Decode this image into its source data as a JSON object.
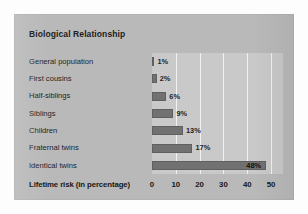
{
  "chart_data": {
    "type": "bar",
    "orientation": "horizontal",
    "title": "Biological Relationship",
    "xlabel": "Lifetime risk (in percentage)",
    "ylabel": "",
    "categories": [
      "General population",
      "First cousins",
      "Half-siblings",
      "Siblings",
      "Children",
      "Fraternal twins",
      "Identical twins"
    ],
    "values": [
      1,
      2,
      6,
      9,
      13,
      17,
      48
    ],
    "value_labels": [
      "1%",
      "2%",
      "6%",
      "9%",
      "13%",
      "17%",
      "48%"
    ],
    "xlim": [
      0,
      55
    ],
    "xticks": [
      0,
      10,
      20,
      30,
      40,
      50
    ],
    "xtick_labels": [
      "0",
      "10",
      "20",
      "30",
      "40",
      "50"
    ],
    "gridlines": [
      10,
      20,
      30,
      40,
      50
    ],
    "grid": true,
    "legend": "none",
    "bar_color": "#717171",
    "plot_background": "#c9c9c9",
    "panel_background": "#b9b9b9",
    "gridline_color": "#f2f2f2",
    "text_color": "#1f1f1f"
  }
}
